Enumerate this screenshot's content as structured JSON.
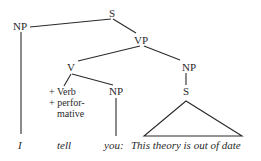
{
  "tree": {
    "nodes": {
      "s": "S",
      "np_subject": "NP",
      "vp": "VP",
      "v": "V",
      "np_object": "NP",
      "np_complement": "NP",
      "s_embedded": "S"
    },
    "features": [
      "+ Verb",
      "+ perfor-",
      "mative"
    ],
    "leaves": {
      "subject": "I",
      "verb": "tell",
      "object": "you:",
      "clause": "This theory is out of date"
    }
  },
  "colors": {
    "line": "#2a2a2a",
    "text": "#2a2a2a",
    "background": "#ffffff"
  }
}
